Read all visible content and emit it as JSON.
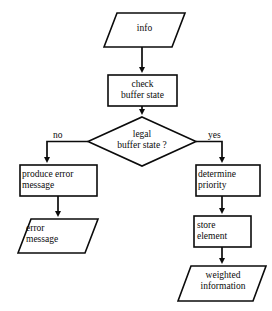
{
  "diagram": {
    "type": "flowchart",
    "background_color": "#ffffff",
    "stroke_color": "#0b0b0b",
    "fill_color": "#ffffff",
    "nodes": [
      {
        "id": "info",
        "shape": "parallelogram",
        "role": "input",
        "label": "info",
        "lines": [
          "info"
        ],
        "font_size": 9.5,
        "x": 104,
        "y": 13,
        "w": 81,
        "h": 34,
        "skew": 13,
        "label_x": 104,
        "label_y": 23,
        "label_w": 81
      },
      {
        "id": "check-buffer-state",
        "shape": "rectangle",
        "role": "process",
        "label": "check buffer state",
        "lines": [
          "check",
          "buffer state"
        ],
        "font_size": 9.5,
        "x": 108,
        "y": 75,
        "w": 69,
        "h": 31,
        "label_x": 108,
        "label_y": 79,
        "label_w": 69
      },
      {
        "id": "legal-buffer-state",
        "shape": "diamond",
        "role": "decision",
        "label": "legal buffer state ?",
        "lines": [
          "legal",
          "buffer state ?"
        ],
        "font_size": 9.5,
        "x": 88,
        "y": 117,
        "w": 108,
        "h": 49,
        "label_x": 88,
        "label_y": 129,
        "label_w": 108
      },
      {
        "id": "produce-error-message",
        "shape": "rectangle",
        "role": "process",
        "label": "produce error message",
        "lines": [
          "produce error",
          "message"
        ],
        "font_size": 9.5,
        "x": 20,
        "y": 165,
        "w": 77,
        "h": 31,
        "label_x": 22,
        "label_y": 169,
        "label_w": 75,
        "align": "left"
      },
      {
        "id": "error-message",
        "shape": "parallelogram",
        "role": "output",
        "label": "error message",
        "lines": [
          "error",
          "message"
        ],
        "font_size": 9.5,
        "x": 18,
        "y": 219,
        "w": 80,
        "h": 34,
        "skew": 13,
        "label_x": 26,
        "label_y": 223,
        "label_w": 62,
        "align": "left"
      },
      {
        "id": "determine-priority",
        "shape": "rectangle",
        "role": "process",
        "label": "determine priority",
        "lines": [
          "determine",
          "priority"
        ],
        "font_size": 9.5,
        "x": 196,
        "y": 165,
        "w": 64,
        "h": 31,
        "label_x": 198,
        "label_y": 169,
        "label_w": 62,
        "align": "left"
      },
      {
        "id": "store-element",
        "shape": "rectangle",
        "role": "process",
        "label": "store element",
        "lines": [
          "store",
          "element"
        ],
        "font_size": 9.5,
        "x": 194,
        "y": 216,
        "w": 57,
        "h": 31,
        "label_x": 197,
        "label_y": 220,
        "label_w": 54,
        "align": "left"
      },
      {
        "id": "weighted-information",
        "shape": "parallelogram",
        "role": "output",
        "label": "weighted information",
        "lines": [
          "weighted",
          "information"
        ],
        "font_size": 9.5,
        "x": 178,
        "y": 266,
        "w": 88,
        "h": 35,
        "skew": 13,
        "label_x": 184,
        "label_y": 270,
        "label_w": 78
      }
    ],
    "edges": [
      {
        "id": "info-to-check",
        "from": "info",
        "to": "check-buffer-state",
        "label": ""
      },
      {
        "id": "check-to-decision",
        "from": "check-buffer-state",
        "to": "legal-buffer-state",
        "label": ""
      },
      {
        "id": "decision-to-produce-error",
        "from": "legal-buffer-state",
        "to": "produce-error-message",
        "label": "no"
      },
      {
        "id": "decision-to-determine-priority",
        "from": "legal-buffer-state",
        "to": "determine-priority",
        "label": "yes"
      },
      {
        "id": "produce-error-to-error-message",
        "from": "produce-error-message",
        "to": "error-message",
        "label": ""
      },
      {
        "id": "determine-to-store",
        "from": "determine-priority",
        "to": "store-element",
        "label": ""
      },
      {
        "id": "store-to-weighted",
        "from": "store-element",
        "to": "weighted-information",
        "label": ""
      }
    ],
    "edge_labels": [
      {
        "id": "no-label",
        "text": "no",
        "x": 53,
        "y": 130,
        "font_size": 9.5
      },
      {
        "id": "yes-label",
        "text": "yes",
        "x": 208,
        "y": 130,
        "font_size": 9.5
      }
    ]
  }
}
